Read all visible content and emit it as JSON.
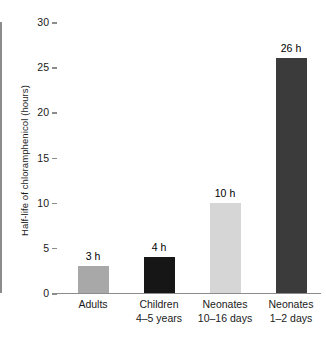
{
  "chart_data": {
    "type": "bar",
    "title": "",
    "subtitle": "",
    "xlabel": "",
    "ylabel": "Half-life of chloramphenicol (hours)",
    "categories": [
      "Adults",
      "Children 4–5 years",
      "Neonates 10–16 days",
      "Neonates 1–2 days"
    ],
    "category_lines": [
      [
        "Adults",
        ""
      ],
      [
        "Children",
        "4–5 years"
      ],
      [
        "Neonates",
        "10–16 days"
      ],
      [
        "Neonates",
        "1–2 days"
      ]
    ],
    "values": [
      3,
      4,
      10,
      26
    ],
    "data_labels": [
      "3 h",
      "4 h",
      "10 h",
      "26 h"
    ],
    "bar_colors": [
      "#a8a8a8",
      "#161616",
      "#d6d6d6",
      "#3b3b3b"
    ],
    "ylim": [
      0,
      30
    ],
    "yticks": [
      0,
      5,
      10,
      15,
      20,
      25,
      30
    ],
    "ytick_labels": [
      "0",
      "5",
      "10",
      "15",
      "20",
      "25",
      "30"
    ],
    "grid": false,
    "legend": false,
    "legend_position": "none",
    "axis_color": "#8c8c8c"
  }
}
